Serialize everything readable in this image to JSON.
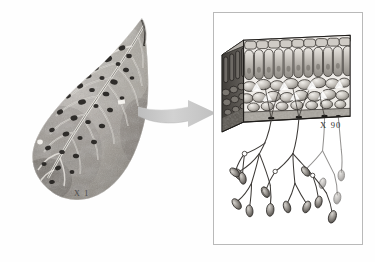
{
  "figure": {
    "background_color": "#ffffff"
  },
  "left_panel": {
    "name": "leaf-photograph",
    "subject": "diseased leaf with dark lesion spots between veins",
    "magnification_label": "X 1",
    "description": "Black and white photograph of a broad ovate leaf with prominent midrib and pinnate lateral veins, showing numerous dark necrotic spots",
    "colors": {
      "lamina_light": "#d8d5d0",
      "lamina_mid": "#a9a49d",
      "lamina_dark": "#6e6a64",
      "lesion": "#2b2926",
      "vein": "#efece7"
    }
  },
  "arrow": {
    "name": "magnification-arrow",
    "direction": "right",
    "color": "#c9c9c9",
    "label": ""
  },
  "right_panel": {
    "name": "leaf-section-plate",
    "magnification_label": "X 90",
    "frame_color": "#b9b9b9",
    "block": {
      "name": "leaf-tissue-block",
      "description": "Three dimensional cut block of leaf tissue",
      "layers": [
        {
          "label": "upper epidermis",
          "cells": "flat rectangular cells"
        },
        {
          "label": "palisade mesophyll",
          "cells": "tall columnar cells"
        },
        {
          "label": "spongy mesophyll",
          "cells": "rounded loosely packed cells with air spaces"
        },
        {
          "label": "lower epidermis",
          "cells": "flat cells with stomata"
        }
      ]
    },
    "fungus": {
      "name": "sporangiophores",
      "description": "Branching sporangiophores emerging through stomata bearing lemon shaped sporangia",
      "sporangia_count": 16,
      "hypha_color": "#3d3a37",
      "sporangium_fill": "#8d8a86"
    }
  }
}
